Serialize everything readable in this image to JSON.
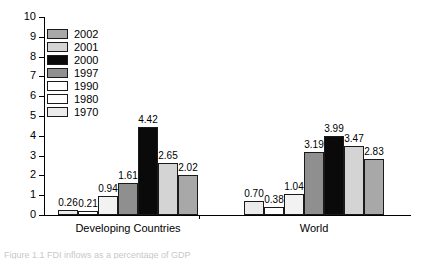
{
  "chart_data": {
    "type": "bar",
    "title": "",
    "xlabel": "",
    "ylabel": "",
    "ylim": [
      0,
      10
    ],
    "ytick_step": 1,
    "yticks": [
      "0",
      "1",
      "2",
      "3",
      "4",
      "5",
      "6",
      "7",
      "8",
      "9",
      "10"
    ],
    "grid": false,
    "legend_position": "upper-left-inside",
    "categories": [
      "Developing Countries",
      "World"
    ],
    "series": [
      {
        "name": "2002",
        "values": [
          2.02,
          2.83
        ],
        "color": "#a8a8a8"
      },
      {
        "name": "2001",
        "values": [
          2.65,
          3.47
        ],
        "color": "#d4d4d4"
      },
      {
        "name": "2000",
        "values": [
          4.42,
          3.99
        ],
        "color": "#0a0a0a"
      },
      {
        "name": "1997",
        "values": [
          1.61,
          3.19
        ],
        "color": "#8f8f8f"
      },
      {
        "name": "1990",
        "values": [
          0.94,
          1.04
        ],
        "color": "#f2f2f2"
      },
      {
        "name": "1980",
        "values": [
          0.21,
          0.38
        ],
        "color": "#ffffff"
      },
      {
        "name": "1970",
        "values": [
          0.26,
          0.7
        ],
        "color": "#ebebeb"
      }
    ],
    "bar_order_left_to_right": [
      "1970",
      "1980",
      "1990",
      "1997",
      "2000",
      "2001",
      "2002"
    ],
    "data_labels": {
      "Developing Countries": [
        "0.26",
        "0.21",
        "0.94",
        "1.61",
        "4.42",
        "2.65",
        "2.02"
      ],
      "World": [
        "0.70",
        "0.38",
        "1.04",
        "3.19",
        "3.99",
        "3.47",
        "2.83"
      ]
    }
  },
  "legend": {
    "items": [
      {
        "label": "2002",
        "color": "#a8a8a8"
      },
      {
        "label": "2001",
        "color": "#d4d4d4"
      },
      {
        "label": "2000",
        "color": "#0a0a0a"
      },
      {
        "label": "1997",
        "color": "#8f8f8f"
      },
      {
        "label": "1990",
        "color": "#ffffff"
      },
      {
        "label": "1980",
        "color": "#ffffff"
      },
      {
        "label": "1970",
        "color": "#ebebeb"
      }
    ]
  },
  "caption": {
    "text": "Figure 1.1  FDI inflows as a percentage of GDP"
  }
}
